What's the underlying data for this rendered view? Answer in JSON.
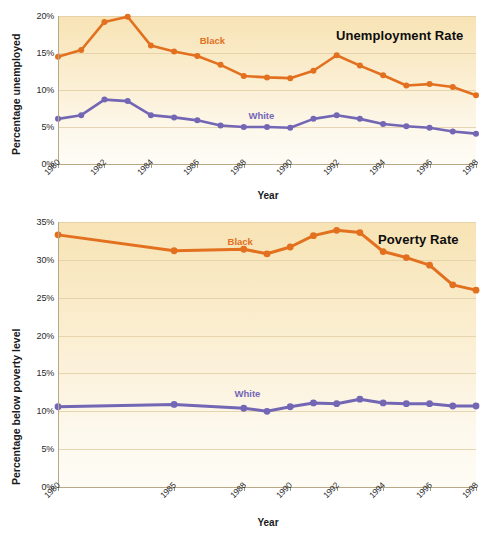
{
  "chart_data": [
    {
      "id": "unemployment",
      "type": "line",
      "title": "Unemployment Rate",
      "xlabel": "Year",
      "ylabel": "Percentage unemployed",
      "xlim": [
        1980,
        1998
      ],
      "ylim": [
        0,
        20
      ],
      "yticks": [
        0,
        5,
        10,
        15,
        20
      ],
      "ytick_labels": [
        "0%",
        "5%",
        "10%",
        "15%",
        "20%"
      ],
      "xticks": [
        1980,
        1982,
        1984,
        1986,
        1988,
        1990,
        1992,
        1994,
        1996,
        1998
      ],
      "xtick_labels": [
        "1980",
        "1982",
        "1984",
        "1986",
        "1988",
        "1990",
        "1992",
        "1994",
        "1996",
        "1998"
      ],
      "grid": true,
      "legend_position": "inline-labels",
      "x": [
        1980,
        1981,
        1982,
        1983,
        1984,
        1985,
        1986,
        1987,
        1988,
        1989,
        1990,
        1991,
        1992,
        1993,
        1994,
        1995,
        1996,
        1997,
        1998
      ],
      "series": [
        {
          "name": "Black",
          "color": "#e2701e",
          "label_x": 1986.1,
          "label_y": 16.6,
          "values": [
            14.5,
            15.4,
            19.2,
            19.9,
            16.0,
            15.2,
            14.6,
            13.4,
            11.9,
            11.7,
            11.6,
            12.6,
            14.7,
            13.3,
            12.0,
            10.6,
            10.8,
            10.4,
            9.3
          ]
        },
        {
          "name": "White",
          "color": "#7366b5",
          "label_x": 1988.2,
          "label_y": 6.5,
          "values": [
            6.1,
            6.6,
            8.7,
            8.5,
            6.6,
            6.3,
            5.9,
            5.2,
            5.0,
            5.0,
            4.9,
            6.1,
            6.6,
            6.1,
            5.4,
            5.1,
            4.9,
            4.4,
            4.1
          ]
        }
      ]
    },
    {
      "id": "poverty",
      "type": "line",
      "title": "Poverty Rate",
      "xlabel": "Year",
      "ylabel": "Percentage below poverty level",
      "xlim": [
        1980,
        1998
      ],
      "ylim": [
        0,
        35
      ],
      "yticks": [
        0,
        5,
        10,
        15,
        20,
        25,
        30,
        35
      ],
      "ytick_labels": [
        "0%",
        "5%",
        "10%",
        "15%",
        "20%",
        "25%",
        "30%",
        "35%"
      ],
      "xticks": [
        1980,
        1985,
        1988,
        1990,
        1992,
        1994,
        1996,
        1998
      ],
      "xtick_labels": [
        "1980",
        "1985",
        "1988",
        "1990",
        "1992",
        "1994",
        "1996",
        "1998"
      ],
      "grid": true,
      "legend_position": "inline-labels",
      "x": [
        1980,
        1985,
        1988,
        1989,
        1990,
        1991,
        1992,
        1993,
        1994,
        1995,
        1996,
        1997,
        1998
      ],
      "series": [
        {
          "name": "Black",
          "color": "#e2701e",
          "label_x": 1987.3,
          "label_y": 32.4,
          "values": [
            33.3,
            31.2,
            31.4,
            30.8,
            31.7,
            33.2,
            33.9,
            33.6,
            31.1,
            30.3,
            29.3,
            26.7,
            26.0
          ]
        },
        {
          "name": "White",
          "color": "#7366b5",
          "label_x": 1987.6,
          "label_y": 12.3,
          "values": [
            10.6,
            10.9,
            10.4,
            10.0,
            10.6,
            11.1,
            11.0,
            11.6,
            11.1,
            11.0,
            11.0,
            10.7,
            10.7
          ]
        }
      ]
    }
  ]
}
